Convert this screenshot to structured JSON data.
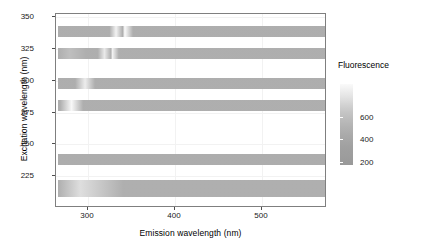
{
  "chart_data": {
    "type": "heatmap",
    "title": "",
    "xlabel": "Emission wavelength (nm)",
    "ylabel": "Excitation wavelength (nm)",
    "xlim": [
      275,
      555
    ],
    "ylim": [
      220,
      352
    ],
    "xticks": [
      300,
      400,
      500
    ],
    "yticks": [
      225,
      250,
      275,
      300,
      325,
      350
    ],
    "grid": true,
    "legend": {
      "title": "Fluorescence",
      "position": "right",
      "ticks": [
        200,
        400,
        600
      ],
      "range": [
        0,
        750
      ],
      "colormap": "grayscale-light-high"
    },
    "note": "Excitation-emission matrix; data present only at discrete excitation wavelengths (horizontal bands). Bright streaks are Rayleigh/Raman scatter peaks.",
    "bands": [
      {
        "excitation": 340,
        "em_start": 277,
        "em_end": 555,
        "base_value": 180,
        "peaks": [
          {
            "emission": 337,
            "value": 660,
            "width": 4
          },
          {
            "emission": 346,
            "value": 720,
            "width": 5
          }
        ]
      },
      {
        "excitation": 325,
        "em_start": 277,
        "em_end": 555,
        "base_value": 185,
        "peaks": [
          {
            "emission": 289,
            "value": 300,
            "width": 10
          },
          {
            "emission": 325,
            "value": 600,
            "width": 4
          },
          {
            "emission": 333,
            "value": 680,
            "width": 4
          }
        ]
      },
      {
        "excitation": 305,
        "em_start": 277,
        "em_end": 555,
        "base_value": 180,
        "peaks": [
          {
            "emission": 305,
            "value": 620,
            "width": 6
          }
        ]
      },
      {
        "excitation": 290,
        "em_start": 277,
        "em_end": 555,
        "base_value": 185,
        "peaks": [
          {
            "emission": 291,
            "value": 700,
            "width": 7
          }
        ]
      },
      {
        "excitation": 253,
        "em_start": 277,
        "em_end": 555,
        "base_value": 175,
        "peaks": []
      },
      {
        "excitation": 233,
        "em_start": 277,
        "em_end": 555,
        "base_value": 190,
        "peaks": [
          {
            "emission": 300,
            "value": 520,
            "width": 26
          }
        ]
      }
    ]
  },
  "axes": {
    "x": {
      "label": "Emission wavelength (nm)",
      "ticks": [
        {
          "value": "300",
          "px": 87
        },
        {
          "value": "400",
          "px": 174
        },
        {
          "value": "500",
          "px": 261
        }
      ]
    },
    "y": {
      "label": "Excitation wavelength (nm)",
      "ticks": [
        {
          "value": "350",
          "px": 16
        },
        {
          "value": "325",
          "px": 48
        },
        {
          "value": "300",
          "px": 80
        },
        {
          "value": "275",
          "px": 112
        },
        {
          "value": "250",
          "px": 143
        },
        {
          "value": "225",
          "px": 175
        }
      ]
    }
  },
  "legend": {
    "title": "Fluorescence",
    "ticks": [
      {
        "value": "600",
        "px": 33
      },
      {
        "value": "400",
        "px": 55
      },
      {
        "value": "200",
        "px": 78
      }
    ]
  },
  "colors": {
    "panel_background": "#ffffff",
    "panel_border": "#7f7f7f",
    "gridline": "#f2f2f2",
    "band_base": "#9c9c9c",
    "peak_high": "#fafafa",
    "text": "#1a1a1a"
  }
}
